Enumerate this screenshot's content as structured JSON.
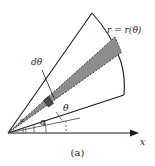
{
  "figure": {
    "caption": "(a)",
    "type": "polar-wedge-area-diagram",
    "labels": {
      "curve_label": "r = r(θ)",
      "dtheta_label": "dθ",
      "theta_label": "θ",
      "alpha_label": "α",
      "alpha_small_label": "α",
      "x_axis_label": "x"
    },
    "colors": {
      "stroke": "#1a1a1a",
      "strip_fill": "#8d8d8d",
      "strip_edge": "#3a3a3a",
      "background": "#ffffff",
      "dashed": "#555555"
    },
    "geometry": {
      "origin": [
        8,
        133
      ],
      "x_axis_end": [
        138,
        133
      ],
      "alpha_deg": 14,
      "theta_deg": 33,
      "dtheta_deg": 5,
      "wedge_start_deg": 14,
      "wedge_end_deg": 58,
      "outer_radius": 118
    },
    "elements": [
      "x-axis-arrow",
      "wedge-lower-edge",
      "wedge-upper-edge",
      "outer-curve",
      "shaded-strip",
      "dtheta-leader",
      "theta-dashed-ray",
      "alpha-arc",
      "alpha-small-arc",
      "alpha-vertical-tick"
    ]
  }
}
